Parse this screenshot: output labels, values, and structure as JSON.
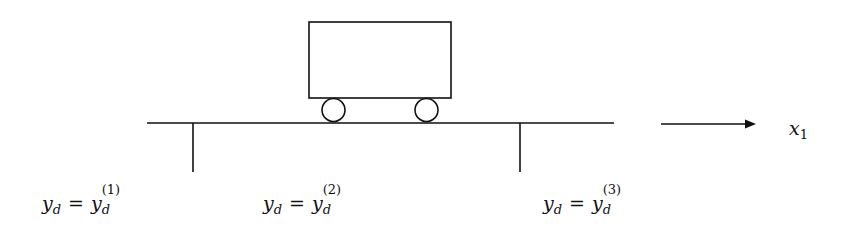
{
  "diagram": {
    "axis_label": {
      "base": "x",
      "subscript": "1"
    },
    "labels": [
      {
        "lhs_base": "y",
        "lhs_sub": "d",
        "eq": "=",
        "rhs_base": "y",
        "rhs_sub": "d",
        "rhs_sup": "(1)"
      },
      {
        "lhs_base": "y",
        "lhs_sub": "d",
        "eq": "=",
        "rhs_base": "y",
        "rhs_sub": "d",
        "rhs_sup": "(2)"
      },
      {
        "lhs_base": "y",
        "lhs_sub": "d",
        "eq": "=",
        "rhs_base": "y",
        "rhs_sub": "d",
        "rhs_sup": "(3)"
      }
    ],
    "colors": {
      "stroke": "#111111",
      "background": "#ffffff"
    }
  }
}
